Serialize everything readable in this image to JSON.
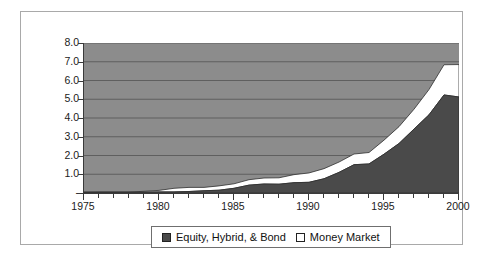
{
  "chart_data": {
    "type": "area",
    "title": "",
    "subtitle": "",
    "xlabel": "",
    "ylabel": "",
    "stacked": true,
    "grid": true,
    "legend_position": "bottom",
    "xlim": [
      1975,
      2000
    ],
    "ylim": [
      0,
      8
    ],
    "x": [
      1975,
      1976,
      1977,
      1978,
      1979,
      1980,
      1981,
      1982,
      1983,
      1984,
      1985,
      1986,
      1987,
      1988,
      1989,
      1990,
      1991,
      1992,
      1993,
      1994,
      1995,
      1996,
      1997,
      1998,
      1999,
      2000
    ],
    "x_tick_labels": [
      "1975",
      "1980",
      "1985",
      "1990",
      "1995",
      "2000"
    ],
    "x_tick_values": [
      1975,
      1980,
      1985,
      1990,
      1995,
      2000
    ],
    "y_tick_labels": [
      "8.0",
      "7.0",
      "6.0",
      "5.0",
      "4.0",
      "3.0",
      "2.0",
      "1.0",
      "-"
    ],
    "y_tick_values": [
      8,
      7,
      6,
      5,
      4,
      3,
      2,
      1,
      0
    ],
    "series": [
      {
        "name": "Equity, Hybrid, & Bond",
        "color": "#4a4a4a",
        "values": [
          0.04,
          0.04,
          0.04,
          0.04,
          0.05,
          0.06,
          0.06,
          0.08,
          0.12,
          0.15,
          0.25,
          0.42,
          0.48,
          0.47,
          0.55,
          0.57,
          0.76,
          1.1,
          1.51,
          1.55,
          2.07,
          2.64,
          3.41,
          4.17,
          5.23,
          5.12
        ]
      },
      {
        "name": "Money Market",
        "color": "#ffffff",
        "values": [
          0.0,
          0.01,
          0.01,
          0.01,
          0.04,
          0.08,
          0.19,
          0.22,
          0.18,
          0.23,
          0.24,
          0.29,
          0.32,
          0.34,
          0.43,
          0.5,
          0.54,
          0.55,
          0.57,
          0.61,
          0.75,
          0.9,
          1.06,
          1.35,
          1.61,
          1.73
        ]
      }
    ],
    "totals": [
      0.04,
      0.05,
      0.05,
      0.05,
      0.09,
      0.14,
      0.25,
      0.3,
      0.3,
      0.38,
      0.49,
      0.71,
      0.8,
      0.81,
      0.98,
      1.07,
      1.3,
      1.65,
      2.08,
      2.16,
      2.82,
      3.54,
      4.47,
      5.52,
      6.84,
      6.85
    ]
  },
  "legend": {
    "entries": [
      {
        "label": "Equity, Hybrid, & Bond",
        "swatch": "filled-square-icon"
      },
      {
        "label": "Money Market",
        "swatch": "hollow-square-icon"
      }
    ]
  },
  "colors": {
    "plot_background": "#8c8c8c",
    "gridline": "#5a5a5a",
    "axis": "#3a3a3a",
    "series_equity": "#4a4a4a",
    "series_money_market": "#ffffff",
    "frame_border": "#a9a9a9",
    "text": "#1b1b1b",
    "page_background": "#ffffff"
  }
}
